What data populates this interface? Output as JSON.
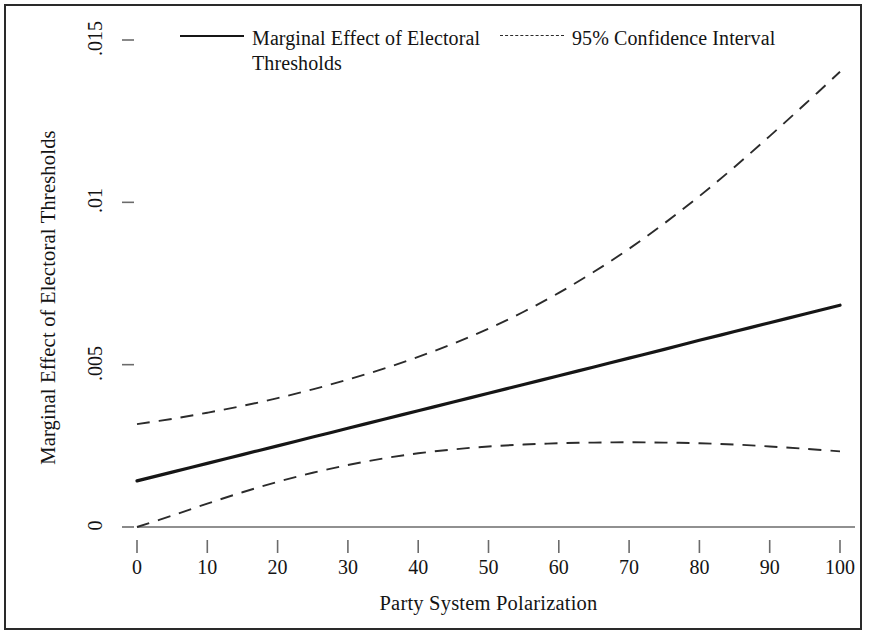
{
  "chart_data": {
    "type": "line",
    "title": "",
    "xlabel": "Party System Polarization",
    "ylabel": "Marginal Effect of Electoral Thresholds",
    "xlim": [
      0,
      100
    ],
    "ylim": [
      0,
      0.015
    ],
    "grid": false,
    "legend_position": "top",
    "x_ticks": [
      "0",
      "10",
      "20",
      "30",
      "40",
      "50",
      "60",
      "70",
      "80",
      "90",
      "100"
    ],
    "x_tick_values": [
      0,
      10,
      20,
      30,
      40,
      50,
      60,
      70,
      80,
      90,
      100
    ],
    "y_ticks": [
      "0",
      ".005",
      ".01",
      ".015"
    ],
    "y_tick_values": [
      0,
      0.005,
      0.01,
      0.015
    ],
    "zero_reference_line": 0,
    "x": [
      0,
      5,
      10,
      15,
      20,
      25,
      30,
      35,
      40,
      45,
      50,
      55,
      60,
      65,
      70,
      75,
      80,
      85,
      90,
      95,
      100
    ],
    "series": [
      {
        "name": "Marginal Effect of Electoral Thresholds",
        "style": "solid",
        "color": "#161616",
        "values": [
          0.00142,
          0.00169,
          0.00196,
          0.00223,
          0.0025,
          0.00277,
          0.00304,
          0.00331,
          0.00358,
          0.00385,
          0.00412,
          0.00439,
          0.00466,
          0.00493,
          0.0052,
          0.00547,
          0.00575,
          0.00602,
          0.00629,
          0.00656,
          0.00683
        ]
      },
      {
        "name": "95% Confidence Interval Upper",
        "style": "dashed",
        "color": "#2b2b2b",
        "values": [
          0.00317,
          0.00333,
          0.00352,
          0.00373,
          0.00397,
          0.00424,
          0.00454,
          0.00487,
          0.00524,
          0.00565,
          0.00611,
          0.00663,
          0.00721,
          0.00786,
          0.00857,
          0.00935,
          0.01019,
          0.01109,
          0.01204,
          0.01302,
          0.01402
        ]
      },
      {
        "name": "95% Confidence Interval Lower",
        "style": "dashed",
        "color": "#2b2b2b",
        "values": [
          0.0,
          0.00035,
          0.00072,
          0.00107,
          0.00139,
          0.00167,
          0.00191,
          0.00211,
          0.00227,
          0.00239,
          0.00248,
          0.00254,
          0.00258,
          0.0026,
          0.00261,
          0.0026,
          0.00258,
          0.00254,
          0.00248,
          0.00241,
          0.00233
        ]
      }
    ]
  },
  "legend": {
    "entries": [
      {
        "label": "Marginal Effect of Electoral Thresholds",
        "style": "solid"
      },
      {
        "label": "95% Confidence Interval",
        "style": "dashed"
      }
    ]
  },
  "axes": {
    "y_title": "Marginal Effect of Electoral Thresholds",
    "x_title": "Party System Polarization"
  },
  "colors": {
    "line": "#161616",
    "ci": "#2b2b2b",
    "axis": "#6b6b6b",
    "frame": "#2a2a2a",
    "background": "#ffffff"
  }
}
